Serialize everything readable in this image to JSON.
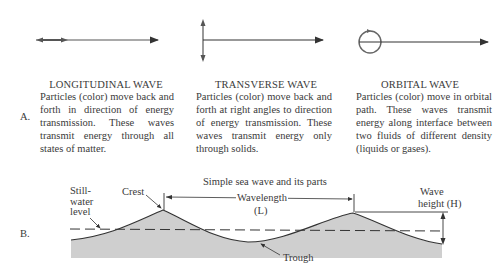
{
  "section_a": {
    "letter": "A.",
    "longitudinal": {
      "title": "LONGITUDINAL WAVE",
      "description": "Particles (color) move back and forth in direction of energy transmission. These waves transmit energy through all states of matter."
    },
    "transverse": {
      "title": "TRANSVERSE WAVE",
      "description": "Particles (color) move back and forth at right angles to direction of energy transmission. These waves transmit energy only through solids."
    },
    "orbital": {
      "title": "ORBITAL WAVE",
      "description": "Particles (color) move in orbital path. These waves transmit energy along interface between two fluids of different density (liquids or gases)."
    }
  },
  "section_b": {
    "letter": "B.",
    "title": "Simple sea wave and its parts",
    "labels": {
      "still_water": "Still-\nwater\nlevel",
      "crest": "Crest",
      "wavelength": "Wavelength",
      "wavelength_symbol": "(L)",
      "wave_height": "Wave",
      "wave_height_2": "height (H)",
      "trough": "Trough"
    }
  },
  "colors": {
    "line": "#333333",
    "water_fill": "#cfcfcf",
    "text": "#3a3a3a"
  }
}
